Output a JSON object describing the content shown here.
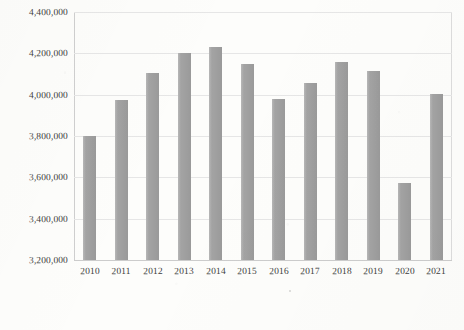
{
  "chart_data": {
    "type": "bar",
    "title": "",
    "subtitle": "",
    "xlabel": "",
    "ylabel": "",
    "categories": [
      "2010",
      "2011",
      "2012",
      "2013",
      "2014",
      "2015",
      "2016",
      "2017",
      "2018",
      "2019",
      "2020",
      "2021"
    ],
    "values": [
      3800000,
      3975000,
      4105000,
      4200000,
      4230000,
      4150000,
      3980000,
      4055000,
      4160000,
      4115000,
      3575000,
      4005000
    ],
    "series": [
      {
        "name": "",
        "values": [
          3800000,
          3975000,
          4105000,
          4200000,
          4230000,
          4150000,
          3980000,
          4055000,
          4160000,
          4115000,
          3575000,
          4005000
        ]
      }
    ],
    "ylim": [
      3200000,
      4400000
    ],
    "ytick_values": [
      3200000,
      3400000,
      3600000,
      3800000,
      4000000,
      4200000,
      4400000
    ],
    "ytick_labels": [
      "3,200,000",
      "3,400,000",
      "3,600,000",
      "3,800,000",
      "4,000,000",
      "4,200,000",
      "4,400,000"
    ],
    "xtick_labels": [
      "2010",
      "2011",
      "2012",
      "2013",
      "2014",
      "2015",
      "2016",
      "2017",
      "2018",
      "2019",
      "2020",
      "2021"
    ],
    "grid": true,
    "grid_axis": "y",
    "legend": false,
    "legend_position": "none",
    "bar_color": "#a3a3a3",
    "gridline_color": "#e6e6e6",
    "axis_color": "#cfcfcf",
    "text_color": "#3d3d3d",
    "background_color": "#fdfdfb"
  }
}
